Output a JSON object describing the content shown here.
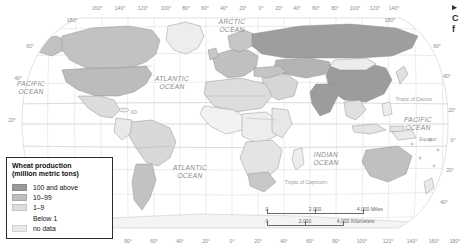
{
  "figure": {
    "kind": "thematic-world-map",
    "projection": "robinson",
    "subject": "Wheat production"
  },
  "legend": {
    "title_line1": "Wheat production",
    "title_line2": "(million metric tons)",
    "items": [
      {
        "label": "100 and above",
        "color": "#9a9a9a"
      },
      {
        "label": "10–99",
        "color": "#bdbdbd"
      },
      {
        "label": "1–9",
        "color": "#dcdcdc"
      },
      {
        "label": "Below 1",
        "color": "#ffffff"
      },
      {
        "label": "no data",
        "color": "#e9e9e9"
      }
    ]
  },
  "scalebar": {
    "miles": {
      "ticks": [
        "0",
        "2,000",
        "4,000"
      ],
      "unit": "Miles"
    },
    "kilometers": {
      "ticks": [
        "0",
        "2,000",
        "4,000"
      ],
      "unit": "Kilometers"
    }
  },
  "side_caption": {
    "lines": [
      "▸",
      "C",
      "f"
    ]
  },
  "ocean_labels": [
    {
      "name": "arctic-ocean",
      "line1": "ARCTIC",
      "line2": "OCEAN",
      "x": 232,
      "y": 24
    },
    {
      "name": "pacific-ocean-west",
      "line1": "PACIFIC",
      "line2": "OCEAN",
      "x": 31,
      "y": 86
    },
    {
      "name": "atlantic-ocean-north",
      "line1": "ATLANTIC",
      "line2": "OCEAN",
      "x": 155,
      "y": 81
    },
    {
      "name": "atlantic-ocean-south",
      "line1": "ATLANTIC",
      "line2": "OCEAN",
      "x": 185,
      "y": 170
    },
    {
      "name": "indian-ocean",
      "line1": "INDIAN",
      "line2": "OCEAN",
      "x": 320,
      "y": 157
    },
    {
      "name": "pacific-ocean-east",
      "line1": "PACIFIC",
      "line2": "OCEAN",
      "x": 418,
      "y": 125
    }
  ],
  "reference_lines": [
    {
      "name": "tropic-of-cancer",
      "label": "Tropic of Cancer",
      "x": 414,
      "y": 101
    },
    {
      "name": "equator",
      "label": "Equator",
      "x": 424,
      "y": 140
    },
    {
      "name": "tropic-of-capricorn",
      "label": "Tropic of Capricorn",
      "x": 301,
      "y": 184
    }
  ],
  "graticule": {
    "top_longitudes": [
      "160°",
      "140°",
      "120°",
      "100°",
      "80°",
      "60°",
      "40°",
      "20°",
      "0°",
      "20°",
      "40°",
      "60°",
      "80°",
      "100°",
      "120°",
      "140°",
      "160°",
      "180°"
    ],
    "bottom_longitudes": [
      "80°",
      "60°",
      "40°",
      "20°",
      "0°",
      "20°",
      "40°",
      "60°",
      "80°",
      "100°",
      "120°",
      "140°",
      "160°",
      "180°"
    ],
    "left_latitudes": [
      "60°",
      "40°",
      "20°"
    ],
    "right_latitudes": [
      "60°",
      "40°",
      "20°",
      "0°",
      "20°",
      "40°"
    ],
    "corner_left_label": "180°",
    "corner_right_label": "180°"
  },
  "colors": {
    "ocean": "#ffffff",
    "graticule": "#d2d2d2",
    "coastline": "#8f8f8f",
    "border": "#9b9b9b",
    "class_high": "#9a9a9a",
    "class_mid": "#bdbdbd",
    "class_low": "#dcdcdc",
    "class_below1": "#fbfbfb",
    "class_nodata": "#ebebeb"
  },
  "regions": [
    {
      "name": "china",
      "class": "class_high"
    },
    {
      "name": "india",
      "class": "class_high"
    },
    {
      "name": "russia",
      "class": "class_high"
    },
    {
      "name": "united-states",
      "class": "class_mid"
    },
    {
      "name": "canada",
      "class": "class_mid"
    },
    {
      "name": "australia",
      "class": "class_mid"
    },
    {
      "name": "argentina",
      "class": "class_mid"
    },
    {
      "name": "europe",
      "class": "class_mid"
    },
    {
      "name": "brazil",
      "class": "class_low"
    },
    {
      "name": "africa-sahel",
      "class": "class_below1"
    }
  ]
}
